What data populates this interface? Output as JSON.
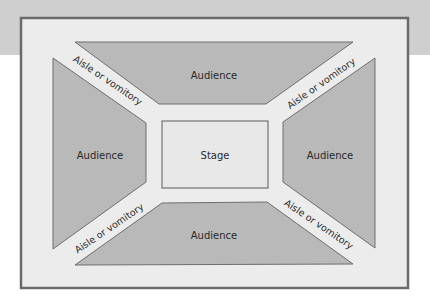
{
  "diagram": {
    "colors": {
      "background_band": "#cfcfcf",
      "frame_border": "#6a6a6a",
      "frame_fill": "#ececec",
      "audience_fill": "#b9b9b9",
      "audience_stroke": "#6e6e6e",
      "stage_fill": "#e8e8e8",
      "stage_stroke": "#5a5a5a",
      "text": "#2a2a2a"
    },
    "stage": {
      "label": "Stage"
    },
    "audience": {
      "top": {
        "label": "Audience"
      },
      "left": {
        "label": "Audience"
      },
      "right": {
        "label": "Audience"
      },
      "bottom": {
        "label": "Audience"
      }
    },
    "aisles": {
      "top_left": {
        "label": "Aisle or vomitory"
      },
      "top_right": {
        "label": "Aisle or vomitory"
      },
      "bottom_left": {
        "label": "Aisle or vomitory"
      },
      "bottom_right": {
        "label": "Aisle or vomitory"
      }
    }
  }
}
